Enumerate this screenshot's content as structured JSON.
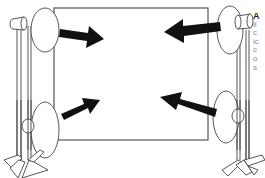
{
  "figure": {
    "screen": {
      "x": 54,
      "y": 8,
      "width": 154,
      "height": 132,
      "stroke": "#555555"
    },
    "lamps": [
      {
        "id": "top-left",
        "disc_cx": 45,
        "disc_cy": 30,
        "arrow_from": [
          62,
          33
        ],
        "arrow_to": [
          102,
          40
        ]
      },
      {
        "id": "bottom-left",
        "disc_cx": 45,
        "disc_cy": 130,
        "arrow_from": [
          62,
          117
        ],
        "arrow_to": [
          100,
          100
        ]
      },
      {
        "id": "top-right",
        "disc_cx": 230,
        "disc_cy": 30,
        "arrow_from": [
          220,
          26
        ],
        "arrow_to": [
          164,
          32
        ]
      },
      {
        "id": "bottom-right",
        "disc_cx": 226,
        "disc_cy": 117,
        "arrow_from": [
          217,
          113
        ],
        "arrow_to": [
          160,
          98
        ]
      }
    ],
    "arrow_color": "#111111",
    "line_color": "#444444"
  },
  "caption": {
    "lead": "A",
    "lines": [
      "li",
      "c",
      "ic",
      "c",
      "o",
      "s"
    ]
  }
}
